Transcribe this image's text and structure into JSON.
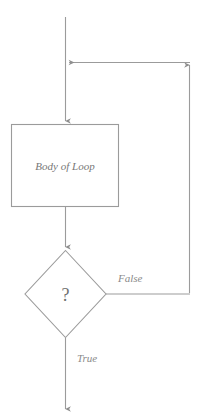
{
  "diagram": {
    "type": "flowchart",
    "canvas": {
      "width": 200,
      "height": 420
    },
    "colors": {
      "stroke": "#999999",
      "shape_fill": "#ffffff",
      "node_text": "#777777",
      "edge_text": "#8a8a8a",
      "background": "#ffffff"
    },
    "nodes": {
      "process": {
        "label": "Body of Loop",
        "shape": "rectangle",
        "x": 11,
        "y": 124,
        "width": 108,
        "height": 83,
        "text_x": 65,
        "text_y": 170,
        "font_size": 11
      },
      "decision": {
        "label": "?",
        "shape": "diamond",
        "cx": 65,
        "cy": 294,
        "half_width": 43,
        "half_height": 44,
        "text_x": 65,
        "text_y": 300,
        "font_size": 17
      }
    },
    "edges": [
      {
        "name": "entry-edge",
        "label": "",
        "from": "top",
        "to": "process",
        "path": "M 65.5 17 L 65.5 122",
        "arrowhead": "down"
      },
      {
        "name": "loopback-edge",
        "label": "",
        "from": "decision",
        "to": "entry-edge",
        "path": "M 105 294 L 190 294 L 190 62 L 68 62",
        "arrowhead": "left-and-up"
      },
      {
        "name": "process-to-decision-edge",
        "label": "",
        "from": "process",
        "to": "decision",
        "path": "M 65.5 207 L 65.5 248",
        "arrowhead": "down"
      },
      {
        "name": "true-edge",
        "label": "True",
        "from": "decision",
        "to": "exit",
        "path": "M 65.5 338 L 65.5 410",
        "arrowhead": "down",
        "label_x": 78,
        "label_y": 361,
        "font_size": 11
      },
      {
        "name": "false-edge",
        "label": "False",
        "from": "decision",
        "to": "loopback-edge",
        "label_x": 118,
        "label_y": 281,
        "font_size": 11
      }
    ],
    "labels": {
      "process_text": "Body of Loop",
      "decision_text": "?",
      "true_text": "True",
      "false_text": "False"
    }
  }
}
